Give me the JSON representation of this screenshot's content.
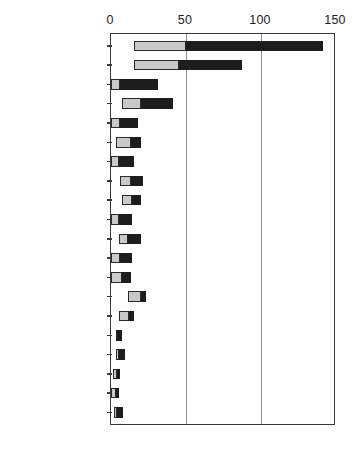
{
  "chart_data": {
    "type": "bar",
    "orientation": "horizontal",
    "stacked": true,
    "title": "",
    "xlabel": "",
    "ylabel": "",
    "xlim": [
      0,
      150
    ],
    "xticks": [
      0,
      50,
      100,
      150
    ],
    "xtick_labels": [
      "0",
      "50",
      "100",
      "150"
    ],
    "grid": true,
    "gridlines_at": [
      50,
      100
    ],
    "legend": "none",
    "categories": [
      "El Salvador",
      "Colombia",
      "Suriname",
      "Jamaica",
      "Ecuador",
      "Costa Rica",
      "Chile",
      "Brazil",
      "ST Vincent",
      "Honduras",
      "Venezuela",
      "Barbados",
      "St Kitts & Nevis",
      "Mexico",
      "Panama",
      "Argentina",
      "Trinidad Tobago",
      "Cuba",
      "Peru",
      "Uruguay"
    ],
    "series": [
      {
        "name": "segment-1",
        "color": "#c9c9c9",
        "values": [
          15,
          15,
          1,
          7,
          1,
          4,
          1,
          6,
          7,
          1,
          5,
          1,
          1,
          11,
          5,
          2,
          2,
          1,
          1,
          2
        ]
      },
      {
        "name": "segment-2",
        "color": "#1d1d1d",
        "values": [
          35,
          30,
          11,
          13,
          6,
          6,
          4,
          5,
          5,
          5,
          5,
          6,
          6,
          4,
          5,
          3,
          4,
          4,
          4,
          4
        ]
      },
      {
        "name": "segment-3",
        "color": "#1d1d1d",
        "values": [
          91,
          42,
          19,
          21,
          11,
          10,
          10,
          10,
          8,
          8,
          10,
          7,
          6,
          5,
          5,
          2,
          3,
          1,
          1,
          2
        ]
      }
    ],
    "totals": [
      141,
      87,
      31,
      41,
      18,
      20,
      15,
      21,
      20,
      14,
      20,
      14,
      13,
      20,
      15,
      7,
      9,
      6,
      6,
      8
    ],
    "segment_breaks": [
      {
        "category": "El Salvador",
        "start": 15,
        "split": 50,
        "end": 141
      },
      {
        "category": "Colombia",
        "start": 15,
        "split": 45,
        "end": 87
      },
      {
        "category": "Suriname",
        "start": 0,
        "split": 6,
        "end": 31
      },
      {
        "category": "Jamaica",
        "start": 7,
        "split": 20,
        "end": 41
      },
      {
        "category": "Ecuador",
        "start": 0,
        "split": 6,
        "end": 18
      },
      {
        "category": "Costa Rica",
        "start": 3,
        "split": 13,
        "end": 20
      },
      {
        "category": "Chile",
        "start": 0,
        "split": 5,
        "end": 15
      },
      {
        "category": "Brazil",
        "start": 6,
        "split": 13,
        "end": 21
      },
      {
        "category": "ST Vincent",
        "start": 7,
        "split": 14,
        "end": 20
      },
      {
        "category": "Honduras",
        "start": 0,
        "split": 5,
        "end": 14
      },
      {
        "category": "Venezuela",
        "start": 5,
        "split": 11,
        "end": 20
      },
      {
        "category": "Barbados",
        "start": 0,
        "split": 6,
        "end": 14
      },
      {
        "category": "St Kitts & Nevis",
        "start": 0,
        "split": 7,
        "end": 13
      },
      {
        "category": "Mexico",
        "start": 11,
        "split": 20,
        "end": 23
      },
      {
        "category": "Panama",
        "start": 5,
        "split": 12,
        "end": 15
      },
      {
        "category": "Argentina",
        "start": 3,
        "split": 4,
        "end": 7
      },
      {
        "category": "Trinidad Tobago",
        "start": 3,
        "split": 5,
        "end": 9
      },
      {
        "category": "Cuba",
        "start": 1,
        "split": 4,
        "end": 6
      },
      {
        "category": "Peru",
        "start": 0,
        "split": 3,
        "end": 5
      },
      {
        "category": "Uruguay",
        "start": 2,
        "split": 4,
        "end": 8
      }
    ]
  }
}
